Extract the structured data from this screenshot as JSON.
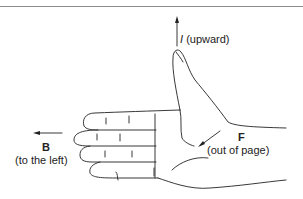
{
  "diagram": {
    "type": "right-hand-rule",
    "labels": {
      "current": {
        "symbol": "I",
        "direction": "(upward)"
      },
      "field": {
        "symbol": "B",
        "direction": "(to the left)"
      },
      "force": {
        "symbol": "F",
        "direction": "(out of page)"
      }
    },
    "colors": {
      "line": "#222222",
      "border": "#8a8a8a",
      "background": "#ffffff"
    }
  }
}
